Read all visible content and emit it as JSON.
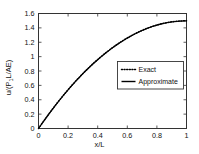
{
  "chart_data": {
    "type": "line",
    "title": "",
    "xlabel": "x/L",
    "ylabel": "u/(P1L/AE)",
    "ylabel_parts": {
      "pre": "u/(P",
      "sub": "1",
      "post": "L/AE)"
    },
    "xlim": [
      0,
      1
    ],
    "ylim": [
      0,
      1.6
    ],
    "xticks": [
      0,
      0.2,
      0.4,
      0.6,
      0.8,
      1
    ],
    "xticklabels": [
      "0",
      "0.2",
      "0.4",
      "0.6",
      "0.8",
      "1"
    ],
    "yticks": [
      0,
      0.2,
      0.4,
      0.6,
      0.8,
      1,
      1.2,
      1.4,
      1.6
    ],
    "yticklabels": [
      "0",
      "0.2",
      "0.4",
      "0.6",
      "0.8",
      "1",
      "1.2",
      "1.4",
      "1.6"
    ],
    "grid": false,
    "legend_position": "center-right",
    "series": [
      {
        "name": "Exact",
        "style": "dotted",
        "color": "#000000",
        "x": [
          0,
          0.025,
          0.05,
          0.075,
          0.1,
          0.125,
          0.15,
          0.175,
          0.2,
          0.225,
          0.25,
          0.275,
          0.3,
          0.325,
          0.35,
          0.375,
          0.4,
          0.425,
          0.45,
          0.475,
          0.5,
          0.525,
          0.55,
          0.575,
          0.6,
          0.625,
          0.65,
          0.675,
          0.7,
          0.725,
          0.75,
          0.775,
          0.8,
          0.825,
          0.85,
          0.875,
          0.9,
          0.925,
          0.95,
          0.975,
          1
        ],
        "y": [
          0,
          0.074,
          0.146,
          0.217,
          0.285,
          0.352,
          0.416,
          0.479,
          0.54,
          0.599,
          0.656,
          0.711,
          0.765,
          0.816,
          0.866,
          0.914,
          0.96,
          1.004,
          1.046,
          1.086,
          1.125,
          1.162,
          1.196,
          1.229,
          1.26,
          1.289,
          1.316,
          1.342,
          1.365,
          1.387,
          1.406,
          1.424,
          1.44,
          1.454,
          1.466,
          1.476,
          1.484,
          1.49,
          1.494,
          1.497,
          1.5
        ]
      },
      {
        "name": "Approximate",
        "style": "solid",
        "color": "#000000",
        "x": [
          0,
          0.025,
          0.05,
          0.075,
          0.1,
          0.125,
          0.15,
          0.175,
          0.2,
          0.225,
          0.25,
          0.275,
          0.3,
          0.325,
          0.35,
          0.375,
          0.4,
          0.425,
          0.45,
          0.475,
          0.5,
          0.525,
          0.55,
          0.575,
          0.6,
          0.625,
          0.65,
          0.675,
          0.7,
          0.725,
          0.75,
          0.775,
          0.8,
          0.825,
          0.85,
          0.875,
          0.9,
          0.925,
          0.95,
          0.975,
          1
        ],
        "y": [
          0,
          0.073,
          0.145,
          0.215,
          0.283,
          0.35,
          0.414,
          0.477,
          0.538,
          0.597,
          0.654,
          0.709,
          0.762,
          0.814,
          0.863,
          0.911,
          0.957,
          1.001,
          1.043,
          1.083,
          1.122,
          1.158,
          1.193,
          1.226,
          1.257,
          1.286,
          1.313,
          1.339,
          1.362,
          1.384,
          1.404,
          1.422,
          1.438,
          1.452,
          1.464,
          1.474,
          1.482,
          1.488,
          1.492,
          1.495,
          1.496
        ]
      }
    ],
    "legend": [
      {
        "label": "Exact",
        "style": "dotted"
      },
      {
        "label": "Approximate",
        "style": "solid"
      }
    ]
  },
  "axes_style": {
    "frame_color": "#333333",
    "tick_color": "#333333",
    "background": "#ffffff",
    "tick_label_size": "7.5px"
  }
}
